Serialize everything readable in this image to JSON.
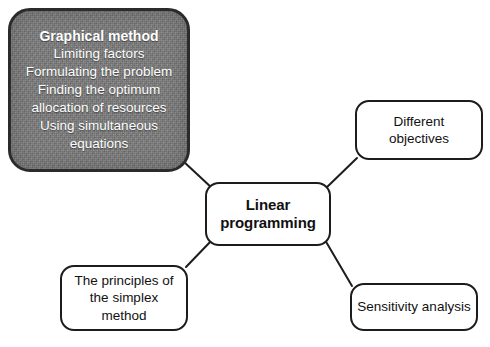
{
  "diagram": {
    "type": "mind-map",
    "background_color": "#ffffff",
    "center": {
      "id": "linear-programming",
      "label": "Linear\nprogramming",
      "bold": true,
      "fill": "#ffffff",
      "border_color": "#1c1c1c"
    },
    "highlighted_node": {
      "id": "graphical-method",
      "fill": "#7c7c7c",
      "text_color": "#ffffff",
      "border_color": "#2b2b2b",
      "lines": [
        {
          "text": "Graphical method",
          "bold": true
        },
        {
          "text": "Limiting factors",
          "bold": false
        },
        {
          "text": "Formulating the problem",
          "bold": false
        },
        {
          "text": "Finding the optimum",
          "bold": false
        },
        {
          "text": "allocation of resources",
          "bold": false
        },
        {
          "text": "Using simultaneous",
          "bold": false
        },
        {
          "text": "equations",
          "bold": false
        }
      ]
    },
    "branches": [
      {
        "id": "different-objectives",
        "label": "Different\nobjectives",
        "fill": "#ffffff",
        "border_color": "#1c1c1c"
      },
      {
        "id": "sensitivity-analysis",
        "label": "Sensitivity analysis",
        "fill": "#ffffff",
        "border_color": "#1c1c1c"
      },
      {
        "id": "simplex-method",
        "label": "The principles of\nthe simplex\nmethod",
        "fill": "#ffffff",
        "border_color": "#1c1c1c"
      }
    ],
    "connectors": [
      {
        "from": "graphical-method",
        "to": "linear-programming"
      },
      {
        "from": "different-objectives",
        "to": "linear-programming"
      },
      {
        "from": "sensitivity-analysis",
        "to": "linear-programming"
      },
      {
        "from": "simplex-method",
        "to": "linear-programming"
      }
    ]
  }
}
